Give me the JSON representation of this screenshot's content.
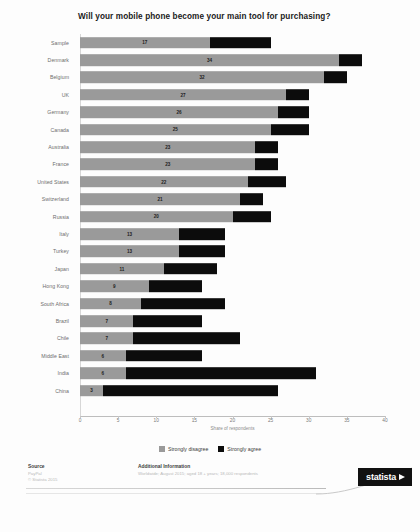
{
  "chart_data": {
    "type": "bar",
    "subtype": "stacked-horizontal",
    "title": "Will your mobile phone become your main tool for purchasing?",
    "xlabel": "Share of respondents",
    "ylabel": "",
    "xlim": [
      0,
      40
    ],
    "xticks": [
      0,
      5,
      10,
      15,
      20,
      25,
      30,
      35,
      40
    ],
    "grid": false,
    "legend_position": "bottom-center",
    "categories": [
      "Sample",
      "Denmark",
      "Belgium",
      "UK",
      "Germany",
      "Canada",
      "Australia",
      "France",
      "United States",
      "Switzerland",
      "Russia",
      "Italy",
      "Turkey",
      "Japan",
      "Hong Kong",
      "South Africa",
      "Brazil",
      "Chile",
      "Middle East",
      "India",
      "China"
    ],
    "series": [
      {
        "name": "Strongly disagree",
        "color": "#9a9a9a",
        "values": [
          17,
          34,
          32,
          27,
          26,
          25,
          23,
          23,
          22,
          21,
          20,
          13,
          13,
          11,
          9,
          8,
          7,
          7,
          6,
          6,
          3
        ]
      },
      {
        "name": "Strongly agree",
        "color": "#0c0c0c",
        "values": [
          8,
          3,
          3,
          3,
          4,
          5,
          3,
          3,
          5,
          3,
          5,
          6,
          6,
          7,
          7,
          11,
          9,
          14,
          10,
          25,
          23
        ]
      }
    ],
    "totals": [
      25,
      37,
      35,
      30,
      30,
      30,
      26,
      26,
      27,
      24,
      25,
      19,
      19,
      18,
      16,
      19,
      16,
      21,
      16,
      31,
      26
    ],
    "data_labels": [
      17,
      34,
      32,
      27,
      26,
      25,
      23,
      23,
      22,
      21,
      20,
      13,
      13,
      11,
      9,
      8,
      7,
      7,
      6,
      6,
      3
    ]
  },
  "legend": {
    "items": [
      {
        "label": "Strongly disagree",
        "color": "#9a9a9a"
      },
      {
        "label": "Strongly agree",
        "color": "#0c0c0c"
      }
    ]
  },
  "footer": {
    "source_heading": "Source",
    "source_lines": [
      "PayPal",
      "© Statista 2015"
    ],
    "additional_heading": "Additional Information",
    "additional_lines": [
      "Worldwide; August 2015; aged 18 + years; 18,000 respondents"
    ],
    "logo_text": "statista"
  }
}
